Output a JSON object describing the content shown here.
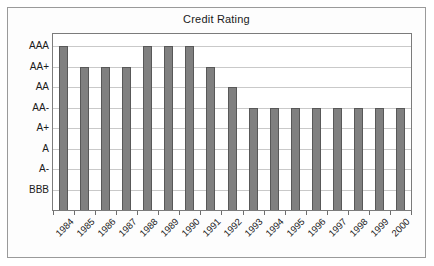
{
  "chart": {
    "title": "Credit Rating"
  },
  "chart_data": {
    "type": "bar",
    "title": "Credit Rating",
    "xlabel": "",
    "ylabel": "",
    "grid": true,
    "legend": false,
    "legend_position": "none",
    "orientation": "vertical",
    "bar_color": "#808080",
    "bar_edge_color": "#585858",
    "plot_background": "#ffffff",
    "gridline_color": "#c9c9c9",
    "categories": [
      "1984",
      "1985",
      "1986",
      "1987",
      "1988",
      "1989",
      "1990",
      "1991",
      "1992",
      "1993",
      "1994",
      "1995",
      "1996",
      "1997",
      "1998",
      "1999",
      "2000"
    ],
    "values": [
      "AAA",
      "AA+",
      "AA+",
      "AA+",
      "AAA",
      "AAA",
      "AAA",
      "AA+",
      "AA",
      "AA-",
      "AA-",
      "AA-",
      "AA-",
      "AA-",
      "AA-",
      "AA-",
      "AA-"
    ],
    "numeric_values": [
      8,
      7,
      7,
      7,
      8,
      8,
      8,
      7,
      6,
      5,
      5,
      5,
      5,
      5,
      5,
      5,
      5
    ],
    "ytick_labels": [
      "AAA",
      "AA+",
      "AA",
      "AA-",
      "A+",
      "A",
      "A-",
      "BBB"
    ],
    "ytick_values": [
      8,
      7,
      6,
      5,
      4,
      3,
      2,
      1
    ],
    "ylim": [
      0,
      8.6
    ]
  }
}
